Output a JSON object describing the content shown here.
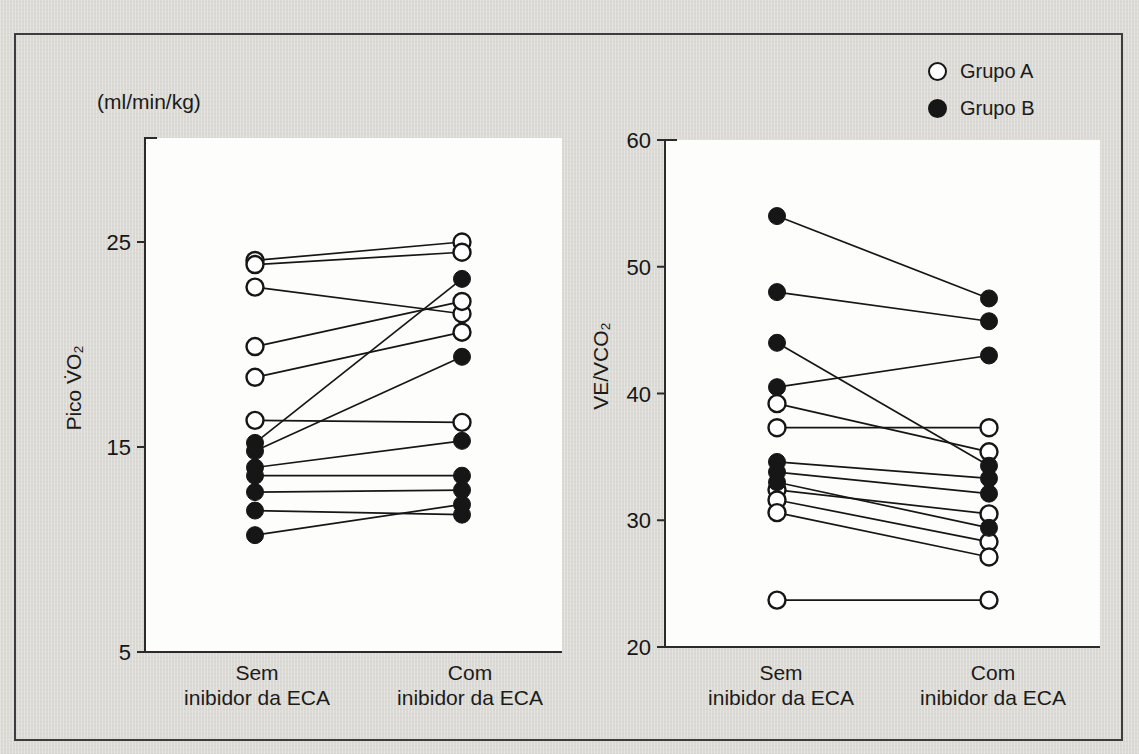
{
  "figure": {
    "colors": {
      "background": "#dbdad5",
      "frame_border": "#3d3d3d",
      "ink": "#161616",
      "axis": "#2b2b2b",
      "plot_bg": "#fdfdfc"
    },
    "legend": [
      {
        "label": "Grupo A",
        "marker": "open-circle"
      },
      {
        "label": "Grupo B",
        "marker": "filled-circle"
      }
    ],
    "legend_position": "top-right"
  },
  "chart_data": [
    {
      "type": "scatter",
      "subtype": "paired-slope",
      "panel": "left",
      "unit_label": "(ml/min/kg)",
      "ylabel": "Pico V̇O₂",
      "categories": [
        {
          "line1": "Sem",
          "line2": "inibidor da ECA"
        },
        {
          "line1": "Com",
          "line2": "inibidor da ECA"
        }
      ],
      "ylim": [
        5,
        27
      ],
      "yticks": [
        5,
        15,
        25
      ],
      "grid": false,
      "series": [
        {
          "name": "Grupo A",
          "marker": "open",
          "pairs": [
            [
              24.1,
              25.0
            ],
            [
              23.9,
              24.5
            ],
            [
              22.8,
              21.5
            ],
            [
              19.9,
              22.1
            ],
            [
              18.4,
              20.6
            ],
            [
              16.3,
              16.2
            ]
          ]
        },
        {
          "name": "Grupo B",
          "marker": "filled",
          "pairs": [
            [
              15.2,
              23.2
            ],
            [
              14.8,
              19.4
            ],
            [
              14.0,
              15.3
            ],
            [
              13.6,
              13.6
            ],
            [
              12.8,
              12.9
            ],
            [
              11.9,
              11.7
            ],
            [
              10.7,
              12.2
            ]
          ]
        }
      ]
    },
    {
      "type": "scatter",
      "subtype": "paired-slope",
      "panel": "right",
      "ylabel": "VE/VCO₂",
      "categories": [
        {
          "line1": "Sem",
          "line2": "inibidor da ECA"
        },
        {
          "line1": "Com",
          "line2": "inibidor da ECA"
        }
      ],
      "ylim": [
        20,
        60
      ],
      "yticks": [
        20,
        30,
        40,
        50,
        60
      ],
      "grid": false,
      "series": [
        {
          "name": "Grupo A",
          "marker": "open",
          "pairs": [
            [
              39.2,
              35.4
            ],
            [
              37.3,
              37.3
            ],
            [
              32.4,
              30.5
            ],
            [
              31.6,
              28.3
            ],
            [
              30.6,
              27.1
            ],
            [
              23.7,
              23.7
            ]
          ]
        },
        {
          "name": "Grupo B",
          "marker": "filled",
          "pairs": [
            [
              54.0,
              47.5
            ],
            [
              48.0,
              45.7
            ],
            [
              44.0,
              34.3
            ],
            [
              40.5,
              43.0
            ],
            [
              34.6,
              33.3
            ],
            [
              33.8,
              32.1
            ],
            [
              33.0,
              29.4
            ]
          ]
        }
      ]
    }
  ]
}
